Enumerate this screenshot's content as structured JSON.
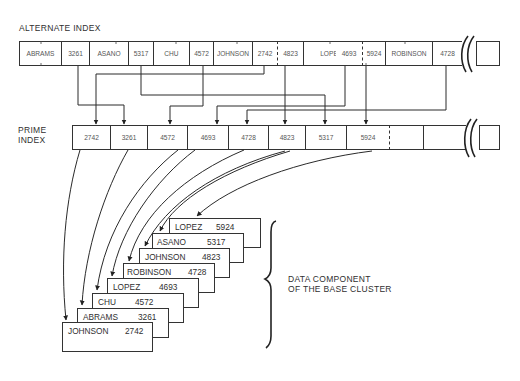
{
  "alternate_index": {
    "title": "ALTERNATE INDEX",
    "cells": [
      {
        "text": "ABRAMS",
        "x": 19,
        "w": 42
      },
      {
        "text": "3261",
        "x": 61,
        "w": 28
      },
      {
        "text": "ASANO",
        "x": 89,
        "w": 39
      },
      {
        "text": "5317",
        "x": 128,
        "w": 25
      },
      {
        "text": "CHU",
        "x": 153,
        "w": 36
      },
      {
        "text": "4572",
        "x": 189,
        "w": 24
      },
      {
        "text": "JOHNSON",
        "x": 213,
        "w": 39
      },
      {
        "text": "2742",
        "x": 252,
        "w": 25
      },
      {
        "text": "4823",
        "x": 277,
        "w": 26
      },
      {
        "text": "LOPEZ",
        "x": 303,
        "w": 55
      },
      {
        "text": "4693",
        "x": 358,
        "w": 4
      },
      {
        "text": "5924",
        "x": 362,
        "w": 23
      },
      {
        "text": "ROBINSON",
        "x": 385,
        "w": 47
      },
      {
        "text": "4728",
        "x": 432,
        "w": 30
      }
    ]
  },
  "prime_index": {
    "title_line1": "PRIME",
    "title_line2": "INDEX",
    "cells": [
      {
        "text": "2742",
        "x": 72,
        "w": 38
      },
      {
        "text": "3261",
        "x": 110,
        "w": 37
      },
      {
        "text": "4572",
        "x": 147,
        "w": 40
      },
      {
        "text": "4693",
        "x": 187,
        "w": 41
      },
      {
        "text": "4728",
        "x": 228,
        "w": 40
      },
      {
        "text": "4823",
        "x": 268,
        "w": 37
      },
      {
        "text": "5317",
        "x": 305,
        "w": 41
      },
      {
        "text": "5924",
        "x": 346,
        "w": 43
      },
      {
        "text": "",
        "x": 389,
        "w": 34
      },
      {
        "text": "",
        "x": 423,
        "w": 42
      }
    ]
  },
  "data_component": {
    "label_line1": "DATA COMPONENT",
    "label_line2": "OF THE BASE CLUSTER",
    "records": [
      {
        "name": "LOPEZ",
        "key": "5924"
      },
      {
        "name": "ASANO",
        "key": "5317"
      },
      {
        "name": "JOHNSON",
        "key": "4823"
      },
      {
        "name": "ROBINSON",
        "key": "4728"
      },
      {
        "name": "LOPEZ",
        "key": "4693"
      },
      {
        "name": "CHU",
        "key": "4572"
      },
      {
        "name": "ABRAMS",
        "key": "3261"
      },
      {
        "name": "JOHNSON",
        "key": "2742"
      }
    ]
  }
}
